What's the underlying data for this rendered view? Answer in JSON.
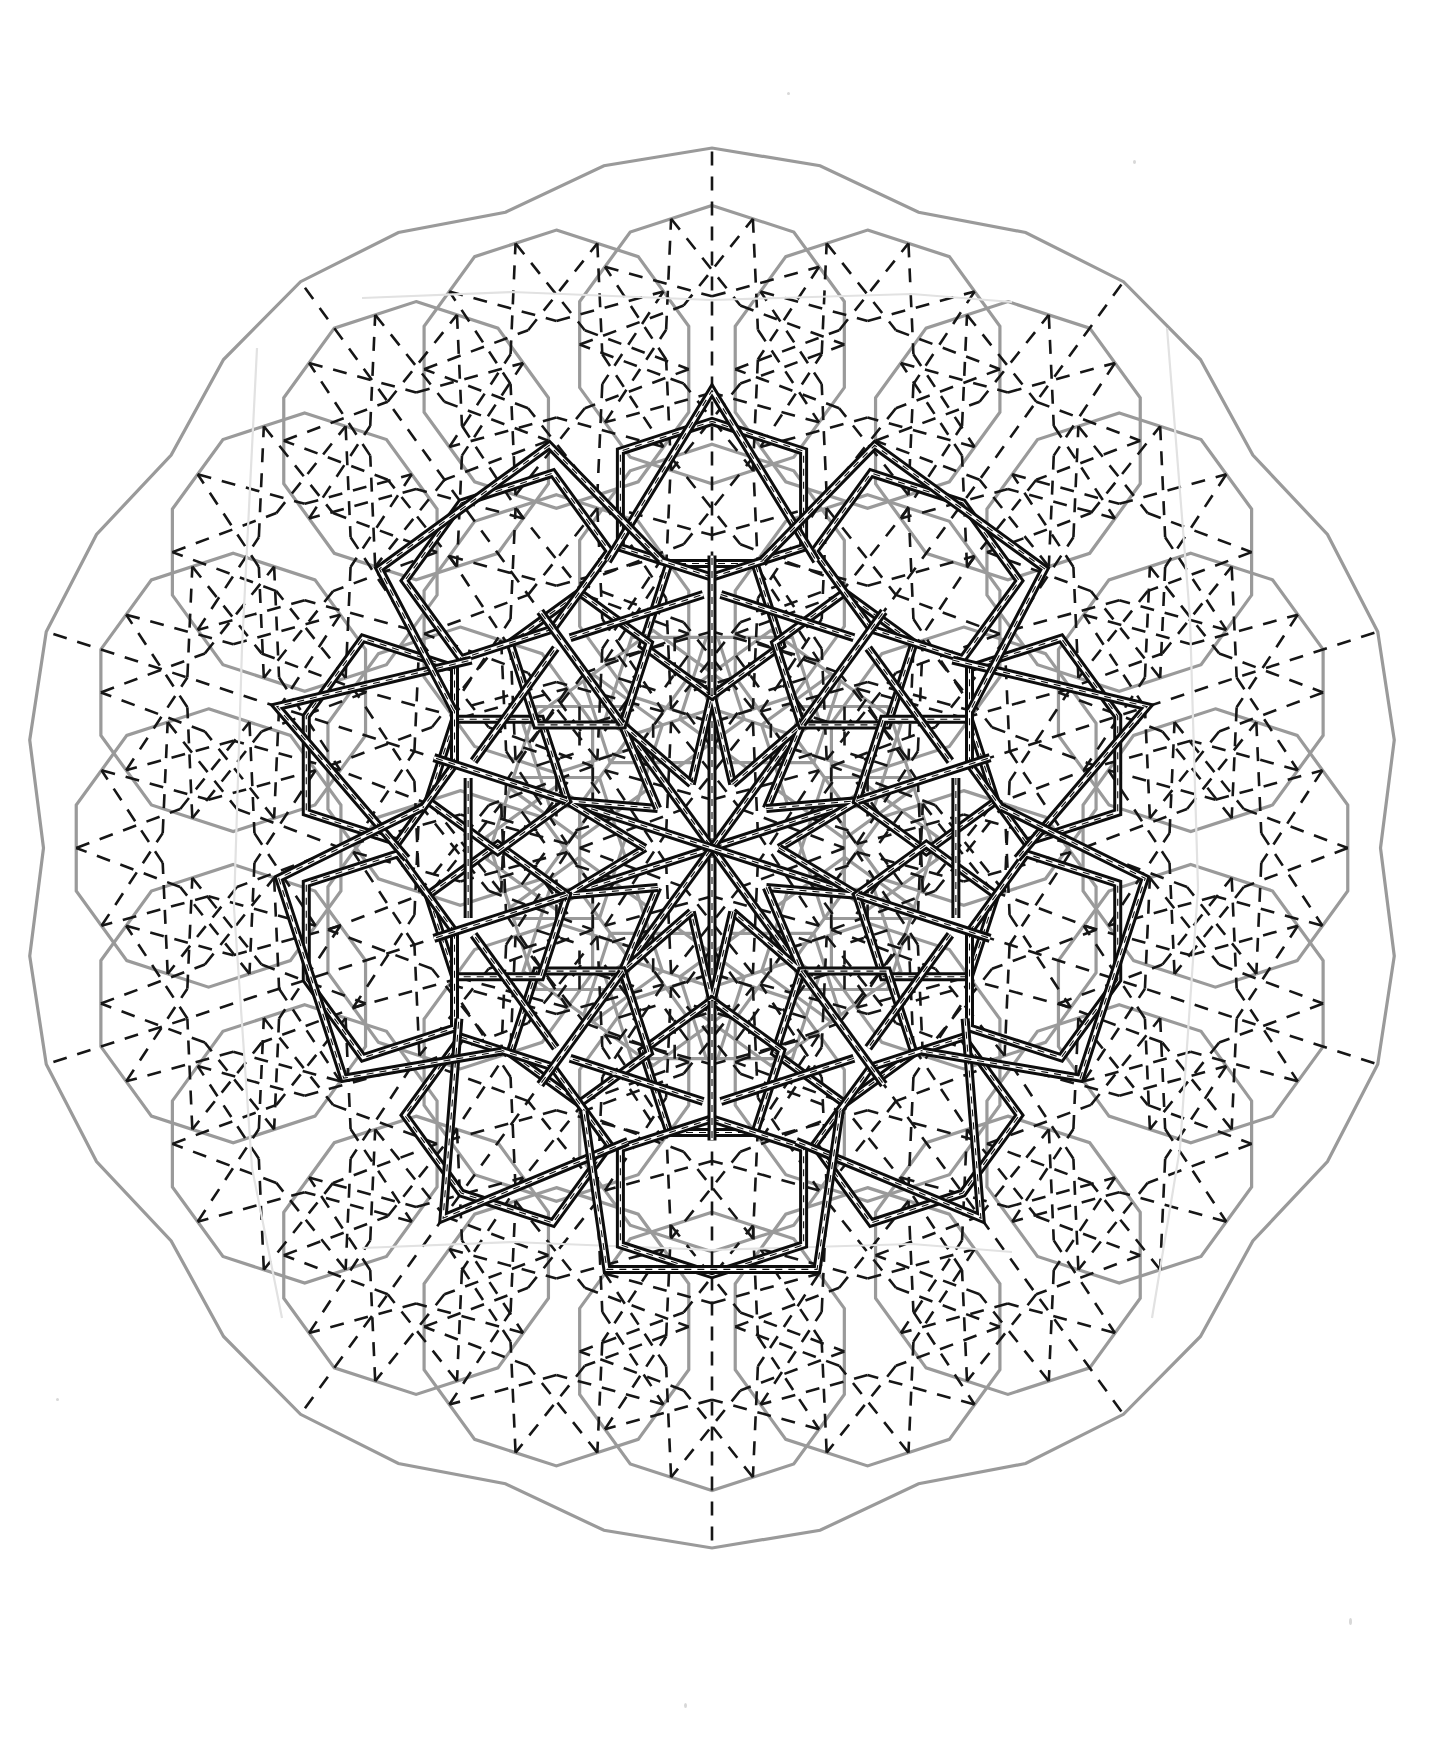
{
  "page": {
    "background_color": "#ffffff",
    "width": 1447,
    "height": 1748
  },
  "figure": {
    "name": "decagonal-girih-rosette-construction",
    "symmetry_order": 10,
    "center": {
      "x": 712,
      "y": 848
    },
    "unit_radius": 86,
    "layers": [
      {
        "id": "tiles",
        "label": "Girih tile outlines",
        "color": "#9a9a9a",
        "stroke_width": 3.2,
        "dash": "none"
      },
      {
        "id": "straps",
        "label": "Girih strap lines",
        "color": "#161616",
        "stroke_width": 2.6,
        "dash": "14 11"
      },
      {
        "id": "motif",
        "label": "Bold rosette motif",
        "color": "#0d0d0d",
        "stroke_width": 9.0,
        "dash": "none"
      },
      {
        "id": "inlay",
        "label": "Motif inner guide line",
        "color": "#ffffff",
        "stroke_width": 3.0,
        "dash": "none"
      },
      {
        "id": "pencil",
        "label": "Faint pencil / crease",
        "color": "#e2e2e2",
        "stroke_width": 2.2,
        "dash": "none"
      }
    ],
    "colors": {
      "tile_grey": "#9a9a9a",
      "strap_black": "#161616",
      "motif_black": "#0d0d0d",
      "paper_white": "#ffffff",
      "pencil_grey": "#e2e2e2"
    },
    "tile_set": [
      {
        "name": "decagon",
        "sides": 10,
        "angle_deg": 144
      },
      {
        "name": "pentagon",
        "sides": 5,
        "angle_deg": 108
      },
      {
        "name": "elongated-hexagon",
        "sides": 6,
        "angle_deg": 72
      },
      {
        "name": "bowtie",
        "sides": 6,
        "angle_deg": 72
      },
      {
        "name": "rhombus",
        "sides": 4,
        "angle_deg": 72
      }
    ],
    "motif": {
      "name": "ten-point-star-rosette",
      "star_points": 10,
      "outer_radius": 470,
      "inner_radius": 150,
      "double_line": true
    },
    "ring_radii": [
      86,
      172,
      258,
      344,
      430,
      516,
      602,
      688
    ],
    "outer_boundary_radius": 700
  },
  "caption": {
    "visible": true,
    "cropped": true,
    "text": ""
  }
}
